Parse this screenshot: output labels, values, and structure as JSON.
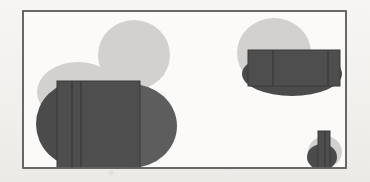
{
  "figure": {
    "title": "Overlapping grayscale shape composition",
    "background_color": "#f2f1ee",
    "frame": {
      "name": "outer-frame",
      "x": 23,
      "y": 11,
      "width": 323,
      "height": 157,
      "stroke_color": "#5a5a5a",
      "stroke_width": 1.4,
      "fill_color": "#fbfaf8"
    },
    "palette": {
      "light_gray": "#d2d1cf",
      "mid_gray": "#a9a8a5",
      "dark_gray": "#4b4b4b",
      "dark_gray_overlap": "#5d5d5d",
      "rect_fill": "#4e4e4e",
      "rect_stroke": "#3a3a3a",
      "paper": "#f2f1ee"
    },
    "groups": [
      {
        "name": "left-cluster",
        "shapes": [
          {
            "name": "light-circle-top-left",
            "type": "circle",
            "cx": 134,
            "cy": 55,
            "rx": 36,
            "ry": 35,
            "fill": "#d2d1cf",
            "opacity": 1
          },
          {
            "name": "light-ellipse-mid-left",
            "type": "ellipse",
            "cx": 78,
            "cy": 92,
            "rx": 41,
            "ry": 30,
            "fill": "#d2d1cf",
            "opacity": 1
          },
          {
            "name": "dark-ellipse-lower-left",
            "type": "ellipse",
            "cx": 80,
            "cy": 124,
            "rx": 44,
            "ry": 43,
            "fill": "#4b4b4b",
            "opacity": 1
          },
          {
            "name": "dark-ellipse-lower-right",
            "type": "ellipse",
            "cx": 131,
            "cy": 126,
            "rx": 46,
            "ry": 42,
            "fill": "#5d5d5d",
            "opacity": 1
          },
          {
            "name": "left-rectangle",
            "type": "rect",
            "x": 57,
            "y": 81,
            "width": 83,
            "height": 87,
            "fill": "#4e4e4e",
            "stroke": "#3a3a3a"
          },
          {
            "name": "left-rectangle-divider-1",
            "type": "line",
            "x1": 72,
            "y1": 81,
            "x2": 72,
            "y2": 168
          },
          {
            "name": "left-rectangle-divider-2",
            "type": "line",
            "x1": 81,
            "y1": 81,
            "x2": 81,
            "y2": 168
          }
        ]
      },
      {
        "name": "right-cluster",
        "shapes": [
          {
            "name": "light-circle-top-right",
            "type": "circle",
            "cx": 274,
            "cy": 53,
            "rx": 37,
            "ry": 35,
            "fill": "#d2d1cf",
            "opacity": 1
          },
          {
            "name": "dark-ellipse-right",
            "type": "ellipse",
            "cx": 292,
            "cy": 74,
            "rx": 50,
            "ry": 22,
            "fill": "#4b4b4b",
            "opacity": 1
          },
          {
            "name": "right-rectangle",
            "type": "rect",
            "x": 248,
            "y": 50,
            "width": 92,
            "height": 36,
            "fill": "#4e4e4e",
            "stroke": "#3a3a3a"
          },
          {
            "name": "right-rectangle-divider-1",
            "type": "line",
            "x1": 273,
            "y1": 50,
            "x2": 273,
            "y2": 86
          },
          {
            "name": "right-rectangle-divider-2",
            "type": "line",
            "x1": 328,
            "y1": 50,
            "x2": 328,
            "y2": 86
          }
        ]
      },
      {
        "name": "bottom-right-cluster",
        "shapes": [
          {
            "name": "light-circle-small",
            "type": "circle",
            "cx": 325,
            "cy": 152,
            "rx": 17,
            "ry": 16,
            "fill": "#d2d1cf",
            "opacity": 1
          },
          {
            "name": "dark-ellipse-small",
            "type": "ellipse",
            "cx": 322,
            "cy": 157,
            "rx": 15,
            "ry": 13,
            "fill": "#4b4b4b",
            "opacity": 1
          },
          {
            "name": "small-rectangle",
            "type": "rect",
            "x": 318,
            "y": 131,
            "width": 12,
            "height": 37,
            "fill": "#4e4e4e",
            "stroke": "#3a3a3a"
          },
          {
            "name": "small-rectangle-divider-1",
            "type": "line",
            "x1": 325,
            "y1": 131,
            "x2": 325,
            "y2": 168
          }
        ]
      }
    ]
  }
}
